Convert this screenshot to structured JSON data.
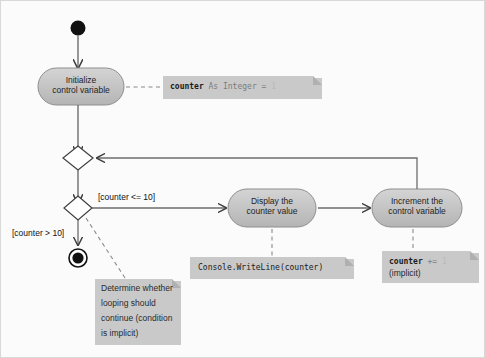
{
  "diagram": {
    "type": "uml-activity-diagram",
    "background_color": "#fbfbfb",
    "node_fill": "#c3c3c3",
    "node_stroke": "#8e8e8e",
    "note_fill": "#c9c9c9",
    "line_color": "#4a4a4a"
  },
  "nodes": {
    "start": {
      "name": "initial-node",
      "shape": "filled-circle"
    },
    "initialize": {
      "line1": "Initialize",
      "line2": "control variable"
    },
    "merge": {
      "name": "merge-node",
      "shape": "diamond"
    },
    "decision": {
      "name": "decision-node",
      "shape": "diamond"
    },
    "display": {
      "line1": "Display the",
      "line2": "counter value"
    },
    "increment": {
      "line1": "Increment the",
      "line2": "control variable"
    },
    "final": {
      "name": "final-node",
      "shape": "bullseye"
    }
  },
  "guards": {
    "loop_continue": "[counter <= 10]",
    "loop_exit": "[counter > 10]"
  },
  "notes": {
    "init_note": {
      "bold": "counter",
      "mid": " As Integer = ",
      "faint": "1"
    },
    "display_note": {
      "code": "Console.WriteLine(counter)"
    },
    "increment_note": {
      "bold": "counter",
      "mid": " += ",
      "faint": "1",
      "line2": "(implicit)"
    },
    "decision_note": {
      "line1": "Determine whether",
      "line2": "looping should",
      "line3": "continue (condition",
      "line4": "is implicit)"
    }
  }
}
